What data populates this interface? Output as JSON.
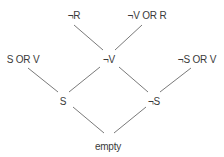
{
  "diagram": {
    "type": "resolution-tree",
    "nodes": [
      {
        "id": "n_not_r",
        "label": "¬R",
        "x": 74,
        "y": 10
      },
      {
        "id": "n_not_v_or_r",
        "label": "¬V OR R",
        "x": 147,
        "y": 10
      },
      {
        "id": "n_s_or_v",
        "label": "S OR V",
        "x": 23,
        "y": 54
      },
      {
        "id": "n_not_v",
        "label": "¬V",
        "x": 109,
        "y": 54
      },
      {
        "id": "n_not_s_or_v",
        "label": "¬S OR V",
        "x": 197,
        "y": 54
      },
      {
        "id": "n_s",
        "label": "S",
        "x": 63,
        "y": 96
      },
      {
        "id": "n_not_s",
        "label": "¬S",
        "x": 154,
        "y": 96
      },
      {
        "id": "n_empty",
        "label": "empty",
        "x": 108,
        "y": 141
      }
    ],
    "edges": [
      {
        "from": "¬R",
        "to": "¬V",
        "x1": 74,
        "y1": 25,
        "x2": 103,
        "y2": 50
      },
      {
        "from": "¬V OR R",
        "to": "¬V",
        "x1": 142,
        "y1": 25,
        "x2": 115,
        "y2": 50
      },
      {
        "from": "S OR V",
        "to": "S",
        "x1": 28,
        "y1": 68,
        "x2": 58,
        "y2": 92
      },
      {
        "from": "¬V",
        "to": "S",
        "x1": 100,
        "y1": 67,
        "x2": 69,
        "y2": 92
      },
      {
        "from": "¬V",
        "to": "¬S",
        "x1": 119,
        "y1": 67,
        "x2": 148,
        "y2": 92
      },
      {
        "from": "¬S OR V",
        "to": "¬S",
        "x1": 191,
        "y1": 68,
        "x2": 160,
        "y2": 92
      },
      {
        "from": "S",
        "to": "empty",
        "x1": 73,
        "y1": 107,
        "x2": 104,
        "y2": 133
      },
      {
        "from": "¬S",
        "to": "empty",
        "x1": 146,
        "y1": 107,
        "x2": 114,
        "y2": 133
      }
    ],
    "colors": {
      "line": "#7a7a7a",
      "text": "#3a3a3a",
      "background": "#ffffff"
    }
  }
}
